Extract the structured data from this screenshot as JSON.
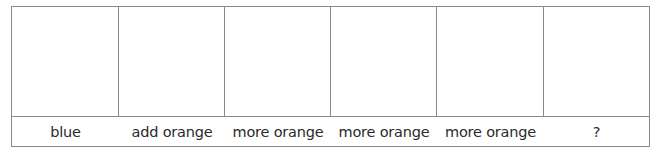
{
  "diagram": {
    "columns": [
      {
        "label": "blue"
      },
      {
        "label": "add orange"
      },
      {
        "label": "more orange"
      },
      {
        "label": "more orange"
      },
      {
        "label": "more orange"
      },
      {
        "label": "?"
      }
    ]
  }
}
